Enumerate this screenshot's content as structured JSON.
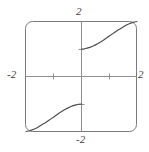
{
  "chart_data": {
    "type": "line",
    "title": "",
    "xlabel": "",
    "ylabel": "",
    "xlim": [
      -2,
      2
    ],
    "ylim": [
      -2,
      2
    ],
    "grid": false,
    "legend": null,
    "frame": "rounded-box",
    "axis_labels": {
      "top": "2",
      "left": "-2",
      "right": "2",
      "bottom": "-2"
    },
    "x_ticks": [
      -1,
      1
    ],
    "y_ticks": [
      -1,
      1
    ],
    "tick_labels_shown": false,
    "series": [
      {
        "name": "upper-right branch",
        "x": [
          0.0,
          0.1,
          0.2,
          0.3,
          0.4,
          0.5,
          0.6,
          0.7,
          0.8,
          0.9,
          1.0,
          1.1,
          1.2,
          1.3,
          1.4,
          1.5,
          1.6,
          1.7,
          1.8,
          1.9,
          2.0
        ],
        "values": [
          1.0,
          1.01,
          1.03,
          1.06,
          1.1,
          1.15,
          1.2,
          1.26,
          1.33,
          1.4,
          1.47,
          1.54,
          1.61,
          1.68,
          1.74,
          1.8,
          1.86,
          1.91,
          1.95,
          1.98,
          2.0
        ]
      },
      {
        "name": "lower-left branch",
        "x": [
          -2.0,
          -1.9,
          -1.8,
          -1.7,
          -1.6,
          -1.5,
          -1.4,
          -1.3,
          -1.2,
          -1.1,
          -1.0,
          -0.9,
          -0.8,
          -0.7,
          -0.6,
          -0.5,
          -0.4,
          -0.3,
          -0.2,
          -0.1,
          0.0
        ],
        "values": [
          -2.0,
          -1.98,
          -1.95,
          -1.91,
          -1.86,
          -1.8,
          -1.74,
          -1.68,
          -1.61,
          -1.54,
          -1.47,
          -1.4,
          -1.33,
          -1.26,
          -1.2,
          -1.15,
          -1.1,
          -1.06,
          -1.03,
          -1.01,
          -1.0
        ]
      }
    ],
    "colors": {
      "curve": "#4a4a4a",
      "axis": "#8a8a8a",
      "frame": "#7a7a7a",
      "label": "#3b3b3b",
      "background": "#ffffff"
    }
  }
}
